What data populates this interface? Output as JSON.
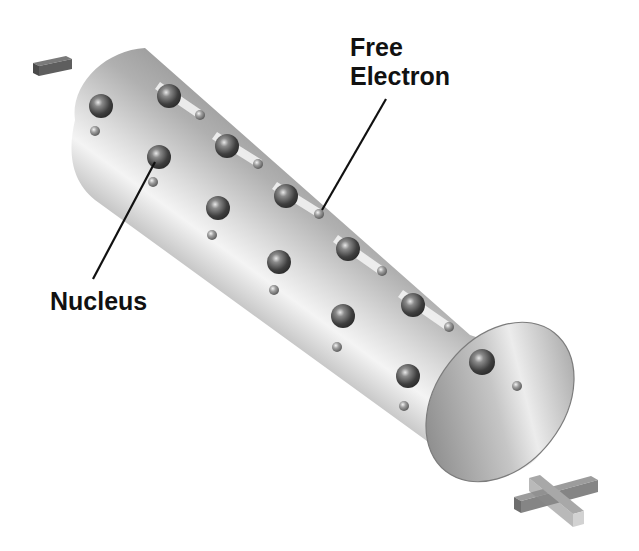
{
  "diagram": {
    "labels": {
      "free_electron_line1": "Free",
      "free_electron_line2": "Electron",
      "nucleus": "Nucleus"
    },
    "terminals": {
      "negative": "minus-symbol",
      "positive": "plus-symbol"
    },
    "colors": {
      "background": "#ffffff",
      "conductor": "#b8b8b8",
      "nucleus": "#5a5a5a",
      "label_text": "#111111",
      "leader_line": "#111111"
    },
    "nuclei_count": 12,
    "free_electron_count": 12
  }
}
